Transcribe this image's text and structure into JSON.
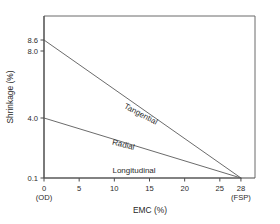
{
  "chart_data": {
    "type": "line",
    "title": "",
    "xlabel": "EMC (%)",
    "ylabel": "Shrinkage (%)",
    "xlim": [
      0,
      30
    ],
    "ylim": [
      0.1,
      8.6
    ],
    "grid": false,
    "legend": "inline-labels",
    "x_ticks": [
      {
        "value": 0,
        "label": "0",
        "sublabel": "(OD)"
      },
      {
        "value": 5,
        "label": "5",
        "sublabel": ""
      },
      {
        "value": 10,
        "label": "10",
        "sublabel": ""
      },
      {
        "value": 15,
        "label": "15",
        "sublabel": ""
      },
      {
        "value": 20,
        "label": "20",
        "sublabel": ""
      },
      {
        "value": 25,
        "label": "25",
        "sublabel": ""
      },
      {
        "value": 28,
        "label": "28",
        "sublabel": "(FSP)"
      }
    ],
    "y_ticks": [
      {
        "value": 8.6,
        "label": "8.6"
      },
      {
        "value": 8.0,
        "label": "8.0"
      },
      {
        "value": 4.0,
        "label": "4.0"
      },
      {
        "value": 0.1,
        "label": "0.1"
      }
    ],
    "series": [
      {
        "name": "Tangential",
        "label": "Tangential",
        "color": "#5a5a5a",
        "x": [
          0,
          28
        ],
        "values": [
          8.6,
          0.1
        ]
      },
      {
        "name": "Radial",
        "label": "Radial",
        "color": "#5a5a5a",
        "x": [
          0,
          28
        ],
        "values": [
          4.0,
          0.1
        ]
      },
      {
        "name": "Longitudinal",
        "label": "Longitudinal",
        "color": "#5a5a5a",
        "x": [
          0,
          28
        ],
        "values": [
          0.1,
          0.1
        ]
      }
    ],
    "annotations": [
      {
        "text": "Tangential",
        "x": 13.6,
        "y": 4.1,
        "rotation": 28
      },
      {
        "text": "Radial",
        "x": 11.2,
        "y": 2.1,
        "rotation": 14
      },
      {
        "text": "Longitudinal",
        "x": 12.8,
        "y": 0.45,
        "rotation": 0
      }
    ]
  },
  "figure": {
    "background_color": "#ffffff",
    "axis_color": "#4a4a4a",
    "frame_color": "#6b6b6b",
    "line_color": "#5a5a5a",
    "text_color": "#2b2b2b"
  }
}
